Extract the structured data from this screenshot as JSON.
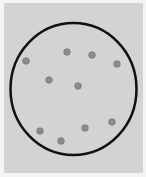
{
  "diagram": {
    "colors": {
      "page_background": "#f4f4f4",
      "panel_background": "#d3d3d3",
      "boundary_stroke": "#111111",
      "particle_fill": "#8c8c8c",
      "particle_stroke": "#7a7a7a"
    },
    "particle_count": 10
  }
}
